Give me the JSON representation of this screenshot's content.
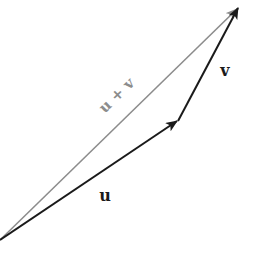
{
  "diagram": {
    "vectors": [
      {
        "id": "u",
        "label": "u",
        "from": [
          0,
          240
        ],
        "to": [
          178,
          120
        ],
        "color": "#1a1a1a"
      },
      {
        "id": "v",
        "label": "v",
        "from": [
          178,
          120
        ],
        "to": [
          238,
          8
        ],
        "color": "#1a1a1a"
      },
      {
        "id": "u_plus_v",
        "label": "u + v",
        "from": [
          0,
          240
        ],
        "to": [
          238,
          8
        ],
        "color": "#8c8c8c"
      }
    ],
    "labels": {
      "u": "u",
      "v": "v",
      "sum": "u + v"
    },
    "colors": {
      "primary": "#1a1a1a",
      "resultant": "#8c8c8c",
      "background": "#ffffff"
    }
  }
}
